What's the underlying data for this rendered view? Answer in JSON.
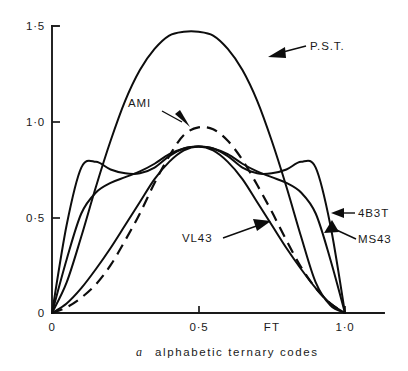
{
  "figure": {
    "caption_index": "a",
    "caption_text": "alphabetic ternary codes"
  },
  "axes": {
    "y_ticks": [
      "1·5",
      "1·0",
      "0·5",
      "0"
    ],
    "x_ticks": [
      "0",
      "0·5",
      "1·0"
    ],
    "x_axis_name": "FT"
  },
  "series_labels": {
    "pst": "P.S.T.",
    "ami": "AMI",
    "vl43": "VL43",
    "b4b3t": "4B3T",
    "ms43": "MS43"
  },
  "chart_data": {
    "type": "line",
    "title": "",
    "xlabel": "FT",
    "ylabel": "",
    "xlim": [
      0,
      1.0
    ],
    "ylim": [
      0,
      1.5
    ],
    "grid": false,
    "legend_position": "inline-annotations",
    "x_tick_values": [
      0,
      0.5,
      1.0
    ],
    "x_tick_labels": [
      "0",
      "0·5",
      "1·0"
    ],
    "y_tick_values": [
      0,
      0.5,
      1.0,
      1.5
    ],
    "y_tick_labels": [
      "0",
      "0·5",
      "1·0",
      "1·5"
    ],
    "annotations": [
      {
        "text": "P.S.T.",
        "points_to_x": 0.72,
        "points_to_y": 1.29
      },
      {
        "text": "AMI",
        "points_to_x": 0.4,
        "points_to_y": 0.92
      },
      {
        "text": "VL43",
        "points_to_x": 0.6,
        "points_to_y": 0.62
      },
      {
        "text": "4B3T",
        "points_to_x": 0.93,
        "points_to_y": 0.58
      },
      {
        "text": "MS43",
        "points_to_x": 0.88,
        "points_to_y": 0.5
      }
    ],
    "x": [
      0.0,
      0.05,
      0.1,
      0.15,
      0.2,
      0.25,
      0.3,
      0.35,
      0.4,
      0.45,
      0.5,
      0.55,
      0.6,
      0.65,
      0.7,
      0.75,
      0.8,
      0.85,
      0.9,
      0.95,
      1.0
    ],
    "series": [
      {
        "name": "P.S.T.",
        "style": "solid",
        "values": [
          0.0,
          0.16,
          0.4,
          0.66,
          0.9,
          1.11,
          1.27,
          1.38,
          1.45,
          1.47,
          1.47,
          1.45,
          1.38,
          1.27,
          1.11,
          0.9,
          0.66,
          0.4,
          0.16,
          0.04,
          0.0
        ]
      },
      {
        "name": "AMI",
        "style": "dashed",
        "values": [
          0.0,
          0.03,
          0.08,
          0.15,
          0.25,
          0.38,
          0.52,
          0.68,
          0.82,
          0.93,
          0.97,
          0.96,
          0.9,
          0.8,
          0.67,
          0.53,
          0.38,
          0.24,
          0.13,
          0.05,
          0.0
        ]
      },
      {
        "name": "VL43",
        "style": "solid",
        "values": [
          0.0,
          0.05,
          0.13,
          0.23,
          0.34,
          0.46,
          0.58,
          0.7,
          0.79,
          0.85,
          0.87,
          0.85,
          0.79,
          0.7,
          0.58,
          0.46,
          0.34,
          0.23,
          0.13,
          0.05,
          0.0
        ]
      },
      {
        "name": "4B3T",
        "style": "solid",
        "values": [
          0.0,
          0.46,
          0.76,
          0.79,
          0.75,
          0.73,
          0.73,
          0.76,
          0.82,
          0.86,
          0.87,
          0.86,
          0.82,
          0.76,
          0.73,
          0.73,
          0.75,
          0.79,
          0.76,
          0.46,
          0.0
        ]
      },
      {
        "name": "MS43",
        "style": "solid",
        "values": [
          0.0,
          0.28,
          0.52,
          0.63,
          0.68,
          0.71,
          0.74,
          0.78,
          0.83,
          0.86,
          0.87,
          0.86,
          0.83,
          0.78,
          0.74,
          0.71,
          0.68,
          0.63,
          0.52,
          0.28,
          0.0
        ]
      }
    ]
  }
}
